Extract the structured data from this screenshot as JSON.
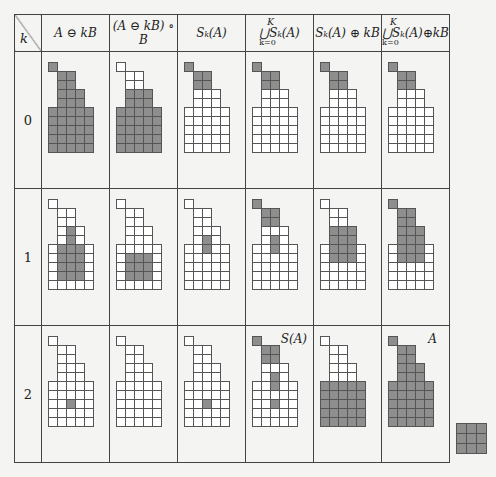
{
  "table": {
    "corner_label": "k",
    "headers": [
      "A⊖kB",
      "(A⊖kB)∘B",
      "S_k(A)",
      "⋃ S_k(A)",
      "S_k(A)⊕kB",
      "⋃ S_k(A)⊕kB"
    ],
    "header_parts": {
      "col1": "A ⊖ kB",
      "col2": "(A ⊖ kB) ∘ B",
      "col3": "Sₖ(A)",
      "col4_top": "K",
      "col4_mid": "⋃Sₖ(A)",
      "col4_bot": "k=0",
      "col5": "Sₖ(A) ⊕ kB",
      "col6_top": "K",
      "col6_mid": "⋃Sₖ(A)⊕kB",
      "col6_bot": "k=0"
    },
    "rows": [
      {
        "k": "0"
      },
      {
        "k": "1"
      },
      {
        "k": "2"
      }
    ],
    "insets": {
      "row2_col4": "S(A)",
      "row2_col6": "A"
    }
  },
  "structuring_element": {
    "label": "B",
    "size": "3x3",
    "all_filled": true
  },
  "shape_A_cells": "row0:[0]; row1-3:[1,2]; row2-3 extra:[3]; rows4-8:[0..4]",
  "colors": {
    "filled": "#8e8e8e",
    "empty": "#ffffff",
    "grid_line": "#555555",
    "background": "#f4f4f2"
  }
}
